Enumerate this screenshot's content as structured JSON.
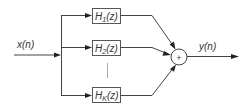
{
  "diagram": {
    "type": "parallel filter bank block diagram",
    "input": {
      "label": "x(n)"
    },
    "output": {
      "label": "y(n)"
    },
    "summer": {
      "symbol": "+"
    },
    "blocks": [
      {
        "name": "H",
        "subscript": "1",
        "arg": "(z)"
      },
      {
        "name": "H",
        "subscript": "2",
        "arg": "(z)"
      },
      {
        "name": "H",
        "subscript": "K",
        "arg": "(z)"
      }
    ],
    "continuation": "vertical line indicating blocks 3..K-1",
    "colors": {
      "line": "#444444",
      "box_stroke": "#555555",
      "separator": "#aaaaaa",
      "text": "#333333"
    }
  }
}
